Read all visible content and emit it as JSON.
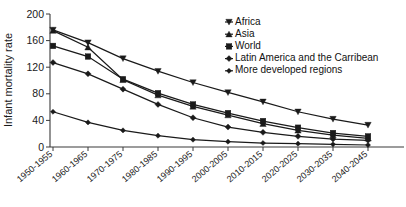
{
  "chart_data": {
    "type": "line",
    "title": "",
    "xlabel": "",
    "ylabel": "Infant mortality rate",
    "ylim": [
      0,
      200
    ],
    "yticks": [
      0,
      40,
      80,
      120,
      160,
      200
    ],
    "grid": false,
    "legend_position": "top-right",
    "categories": [
      "1950-1955",
      "1960-1965",
      "1970-1975",
      "1980-1985",
      "1990-1995",
      "2000-2005",
      "2010-2015",
      "2020-2025",
      "2030-2035",
      "2040-2045"
    ],
    "series": [
      {
        "name": "Africa",
        "marker": "triangle-down",
        "values": [
          176,
          157,
          133,
          114,
          97,
          82,
          68,
          53,
          42,
          33
        ]
      },
      {
        "name": "Asia",
        "marker": "triangle-up",
        "values": [
          175,
          150,
          101,
          78,
          61,
          48,
          35,
          25,
          18,
          13
        ]
      },
      {
        "name": "World",
        "marker": "square",
        "values": [
          152,
          136,
          102,
          81,
          64,
          51,
          39,
          29,
          21,
          16
        ]
      },
      {
        "name": "Latin America and the Carribean",
        "marker": "diamond",
        "values": [
          127,
          110,
          87,
          64,
          44,
          30,
          22,
          16,
          12,
          10
        ]
      },
      {
        "name": "More developed regions",
        "marker": "diamond-small",
        "values": [
          53,
          37,
          25,
          17,
          11,
          8,
          6,
          5,
          4,
          3
        ]
      }
    ]
  },
  "axis": {
    "y_label": "Infant mortality rate",
    "y_ticks": [
      "200",
      "160",
      "120",
      "80",
      "40",
      "0"
    ],
    "x_ticks": [
      "1950-1955",
      "1960-1965",
      "1970-1975",
      "1980-1985",
      "1990-1995",
      "2000-2005",
      "2010-2015",
      "2020-2025",
      "2030-2035",
      "2040-2045"
    ]
  },
  "legend": {
    "items": [
      {
        "label": "Africa",
        "marker": "triangle-down-icon"
      },
      {
        "label": "Asia",
        "marker": "triangle-up-icon"
      },
      {
        "label": "World",
        "marker": "square-icon"
      },
      {
        "label": "Latin America and the Carribean",
        "marker": "diamond-icon"
      },
      {
        "label": "More developed regions",
        "marker": "diamond-small-icon"
      }
    ]
  },
  "colors": {
    "ink": "#1a1a1a",
    "axis": "#3a3a3a",
    "background": "#ffffff"
  }
}
